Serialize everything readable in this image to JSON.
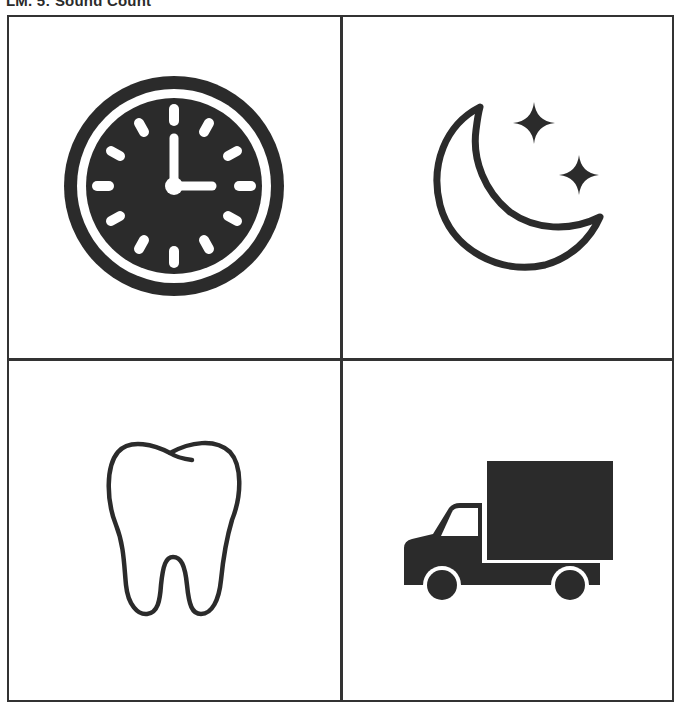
{
  "header": {
    "title": "LM. 5: Sound Count"
  },
  "grid": {
    "rows": 2,
    "columns": 2,
    "border_color": "#333333",
    "cells": [
      {
        "position": "top-left",
        "icon": "clock-icon",
        "label": "clock"
      },
      {
        "position": "top-right",
        "icon": "moon-stars-icon",
        "label": "moon"
      },
      {
        "position": "bottom-left",
        "icon": "tooth-icon",
        "label": "tooth"
      },
      {
        "position": "bottom-right",
        "icon": "truck-icon",
        "label": "truck"
      }
    ]
  },
  "colors": {
    "ink": "#2b2b2b",
    "background": "#ffffff"
  }
}
